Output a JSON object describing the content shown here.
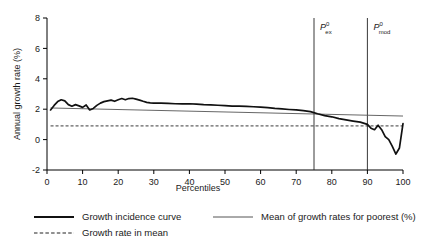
{
  "chart_data": {
    "type": "line",
    "title": "",
    "xlabel": "Percentiles",
    "ylabel": "Annual growth rate (%)",
    "xlim": [
      0,
      100
    ],
    "ylim": [
      -2,
      8
    ],
    "xticks": [
      0,
      10,
      20,
      30,
      40,
      50,
      60,
      70,
      80,
      90,
      100
    ],
    "xtick_labels": [
      "0",
      "10",
      "20",
      "30",
      "40",
      "50",
      "60",
      "70",
      "80",
      "90",
      "100"
    ],
    "yticks": [
      -2,
      0,
      2,
      4,
      6,
      8
    ],
    "ytick_labels": [
      "-2",
      "0",
      "2",
      "4",
      "6",
      "8"
    ],
    "grid": false,
    "legend_position": "below",
    "series": [
      {
        "name": "Growth incidence curve",
        "style": "solid-thick",
        "color": "#111111",
        "x": [
          1,
          2,
          3,
          4,
          5,
          6,
          7,
          8,
          9,
          10,
          11,
          12,
          13,
          14,
          15,
          16,
          17,
          18,
          19,
          20,
          21,
          22,
          23,
          24,
          25,
          26,
          27,
          28,
          29,
          30,
          32,
          34,
          36,
          38,
          40,
          42,
          44,
          46,
          48,
          50,
          52,
          54,
          56,
          58,
          60,
          62,
          64,
          66,
          68,
          70,
          72,
          74,
          76,
          78,
          80,
          82,
          84,
          86,
          88,
          90,
          91,
          92,
          93,
          94,
          95,
          96,
          97,
          98,
          99,
          100
        ],
        "y": [
          1.95,
          2.25,
          2.5,
          2.62,
          2.55,
          2.3,
          2.2,
          2.3,
          2.22,
          2.12,
          2.28,
          1.95,
          2.05,
          2.25,
          2.4,
          2.5,
          2.55,
          2.6,
          2.52,
          2.62,
          2.7,
          2.62,
          2.7,
          2.72,
          2.66,
          2.6,
          2.52,
          2.45,
          2.42,
          2.4,
          2.4,
          2.38,
          2.36,
          2.35,
          2.36,
          2.34,
          2.3,
          2.28,
          2.26,
          2.24,
          2.2,
          2.2,
          2.18,
          2.16,
          2.14,
          2.1,
          2.05,
          2.02,
          1.98,
          1.95,
          1.9,
          1.84,
          1.7,
          1.58,
          1.5,
          1.38,
          1.3,
          1.22,
          1.15,
          1.0,
          0.75,
          0.65,
          0.95,
          0.65,
          0.2,
          0.0,
          -0.45,
          -0.95,
          -0.55,
          1.05
        ]
      },
      {
        "name": "Mean of growth rates for poorest (%)",
        "style": "solid-thin",
        "color": "#555555",
        "x": [
          1,
          100
        ],
        "y": [
          2.08,
          1.55
        ]
      },
      {
        "name": "Growth rate in mean",
        "style": "dashed",
        "color": "#222222",
        "x": [
          1,
          100
        ],
        "y": [
          0.9,
          0.9
        ]
      }
    ],
    "annotations": [
      {
        "label": "P",
        "superscript": "0",
        "subscript": "ex",
        "x": 75,
        "type": "vline"
      },
      {
        "label": "P",
        "superscript": "0",
        "subscript": "mod",
        "x": 90,
        "type": "vline"
      }
    ]
  },
  "legend": {
    "items": [
      {
        "label": "Growth incidence curve",
        "style": "solid-thick"
      },
      {
        "label": "Mean of growth rates for poorest (%)",
        "style": "solid-thin"
      },
      {
        "label": "Growth rate in mean",
        "style": "dashed"
      }
    ]
  }
}
